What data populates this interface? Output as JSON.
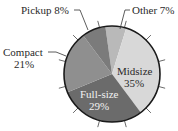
{
  "chart_data": {
    "type": "pie",
    "title": "",
    "categories": [
      "Other",
      "Midsize",
      "Full-size",
      "Compact",
      "Pickup"
    ],
    "values": [
      7,
      35,
      29,
      21,
      8
    ],
    "unit": "%",
    "labels": [
      "Other 7%",
      "Midsize 35%",
      "Full-size 29%",
      "Compact 21%",
      "Pickup 8%"
    ],
    "colors": [
      "#b9b9b9",
      "#d8d8d8",
      "#6b6b6b",
      "#8f8f8f",
      "#7b7b7b"
    ],
    "start_angle_deg": -8,
    "direction": "clockwise",
    "tick_marks": true,
    "legend": "none"
  },
  "labels": {
    "other": "Other 7%",
    "pickup": "Pickup 8%",
    "compact_name": "Compact",
    "compact_pct": "21%",
    "midsize_name": "Midsize",
    "midsize_pct": "35%",
    "fullsize_name": "Full-size",
    "fullsize_pct": "29%"
  }
}
